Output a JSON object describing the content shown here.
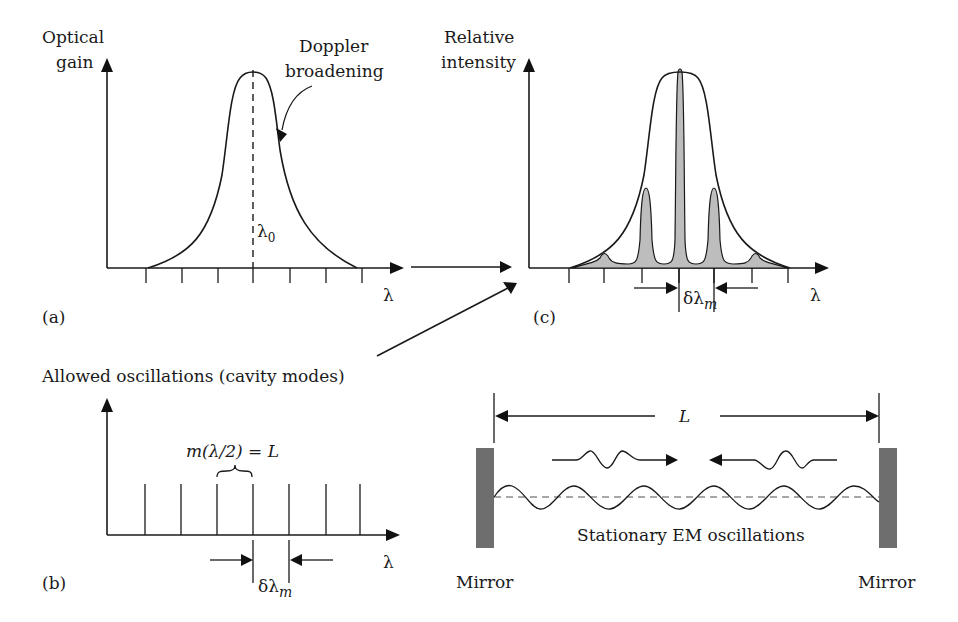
{
  "panel_a": {
    "tag": "(a)",
    "y_label_line1": "Optical",
    "y_label_line2": "gain",
    "x_label": "λ",
    "center_label": "λ",
    "center_sub": "0",
    "annotation_line1": "Doppler",
    "annotation_line2": "broadening"
  },
  "panel_b": {
    "tag": "(b)",
    "title": "Allowed oscillations (cavity modes)",
    "x_label": "λ",
    "formula": "m(λ/2) = L",
    "spacing_label": "δλ",
    "spacing_sub": "m"
  },
  "panel_c": {
    "tag": "(c)",
    "y_label_line1": "Relative",
    "y_label_line2": "intensity",
    "x_label": "λ",
    "spacing_label": "δλ",
    "spacing_sub": "m"
  },
  "cavity": {
    "length_label": "L",
    "caption": "Stationary EM oscillations",
    "left_mirror": "Mirror",
    "right_mirror": "Mirror"
  },
  "colors": {
    "ink": "#1a1a1a",
    "mirror": "#6e6e6e",
    "mode_fill": "#bdbdbd",
    "standing_wave_axis": "#8a8a8a"
  }
}
